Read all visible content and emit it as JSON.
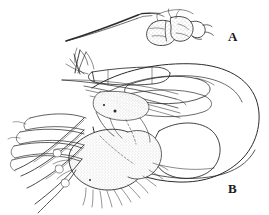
{
  "figure": {
    "background_color": "#ffffff",
    "ink_color": "#2b2b2b",
    "stipple_color": "#8d8d8d",
    "width": 269,
    "height": 215,
    "header_fragment_text": "Fig. 4. Cnephia",
    "panels": [
      {
        "id": "A",
        "label": "A",
        "subject": "stylet-with-stippled-lobes"
      },
      {
        "id": "B",
        "label": "B",
        "subject": "head-with-palps-labellum-and-bristles"
      }
    ]
  },
  "labels": {
    "panel_a": "A",
    "panel_b": "B"
  }
}
